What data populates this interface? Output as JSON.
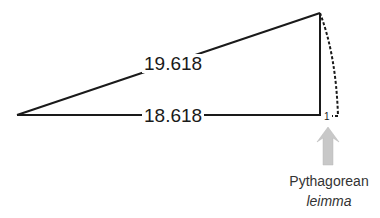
{
  "diagram": {
    "hypotenuse_label": "19.618",
    "base_label": "18.618",
    "leg_label": "1",
    "caption": {
      "line1": "Pythagorean",
      "line2": "leimma"
    },
    "colors": {
      "line": "#1a1a1a",
      "arrow": "#c8c8c8"
    }
  }
}
